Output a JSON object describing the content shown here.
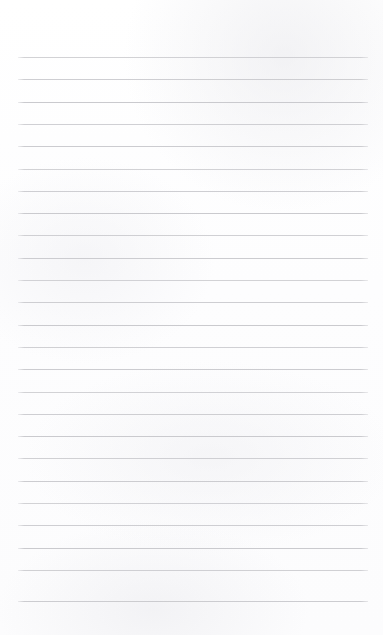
{
  "document": {
    "kind": "lined-notepad-page",
    "title": "Blank Lined Notepad Page",
    "content_text": "",
    "page_width": 383,
    "page_height": 635,
    "background_color": "#fdfdfd",
    "is_blank": "true"
  },
  "ruling": {
    "line_color": "#c9c9cd",
    "line_thickness": 1,
    "line_spacing": 22.3,
    "line_left": 18,
    "line_right": 368,
    "line_width": 350,
    "first_line_y": 57,
    "last_line_y": 601,
    "line_count": 25,
    "has_margin_rule": "false",
    "top_margin": 57,
    "bottom_margin": 33
  },
  "lines": [
    {
      "index": 1,
      "y": 57,
      "text": ""
    },
    {
      "index": 2,
      "y": 79.3,
      "text": ""
    },
    {
      "index": 3,
      "y": 101.6,
      "text": ""
    },
    {
      "index": 4,
      "y": 123.9,
      "text": ""
    },
    {
      "index": 5,
      "y": 146.2,
      "text": ""
    },
    {
      "index": 6,
      "y": 168.5,
      "text": ""
    },
    {
      "index": 7,
      "y": 190.8,
      "text": ""
    },
    {
      "index": 8,
      "y": 213.1,
      "text": ""
    },
    {
      "index": 9,
      "y": 235.4,
      "text": ""
    },
    {
      "index": 10,
      "y": 257.7,
      "text": ""
    },
    {
      "index": 11,
      "y": 280.0,
      "text": ""
    },
    {
      "index": 12,
      "y": 302.3,
      "text": ""
    },
    {
      "index": 13,
      "y": 324.6,
      "text": ""
    },
    {
      "index": 14,
      "y": 346.9,
      "text": ""
    },
    {
      "index": 15,
      "y": 369.2,
      "text": ""
    },
    {
      "index": 16,
      "y": 391.5,
      "text": ""
    },
    {
      "index": 17,
      "y": 413.8,
      "text": ""
    },
    {
      "index": 18,
      "y": 436.1,
      "text": ""
    },
    {
      "index": 19,
      "y": 458.4,
      "text": ""
    },
    {
      "index": 20,
      "y": 480.7,
      "text": ""
    },
    {
      "index": 21,
      "y": 503.0,
      "text": ""
    },
    {
      "index": 22,
      "y": 525.3,
      "text": ""
    },
    {
      "index": 23,
      "y": 547.6,
      "text": ""
    },
    {
      "index": 24,
      "y": 569.9,
      "text": ""
    },
    {
      "index": 25,
      "y": 601.0,
      "text": ""
    }
  ]
}
